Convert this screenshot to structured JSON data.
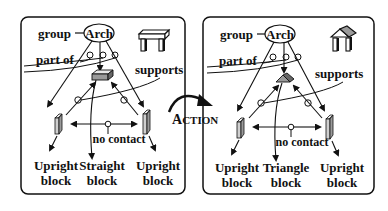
{
  "panels": [
    {
      "id": "before",
      "root_label": "Arch",
      "group_label": "group",
      "part_of_label": "part of",
      "supports_label": "supports",
      "no_contact_label": "no contact",
      "blocks": [
        {
          "line1": "Upright",
          "line2": "block"
        },
        {
          "line1": "Straight",
          "line2": "block"
        },
        {
          "line1": "Upright",
          "line2": "block"
        }
      ],
      "top_shape": "flat-lintel",
      "icon": "table-arch-icon"
    },
    {
      "id": "after",
      "root_label": "Arch",
      "group_label": "group",
      "part_of_label": "part of",
      "supports_label": "supports",
      "no_contact_label": "no contact",
      "blocks": [
        {
          "line1": "Upright",
          "line2": "block"
        },
        {
          "line1": "Triangle",
          "line2": "block"
        },
        {
          "line1": "Upright",
          "line2": "block"
        }
      ],
      "top_shape": "triangle-roof",
      "icon": "temple-arch-icon"
    }
  ],
  "action": {
    "label_first": "A",
    "label_rest": "CTION"
  },
  "colors": {
    "stroke": "#111111",
    "block_fill": "#9a9a9a",
    "block_side": "#e8e8e8",
    "background": "#ffffff"
  }
}
